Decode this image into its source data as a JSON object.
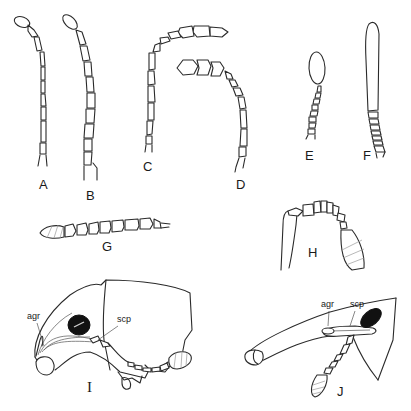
{
  "figure": {
    "panels": [
      {
        "id": "A",
        "label": "A",
        "subject": "antenna, filiform with slender club"
      },
      {
        "id": "B",
        "label": "B",
        "subject": "antenna, gradually thickened"
      },
      {
        "id": "C",
        "label": "C",
        "subject": "antenna, curved with 3-segmented club"
      },
      {
        "id": "D",
        "label": "D",
        "subject": "antenna, curved with rounded 3-segmented club"
      },
      {
        "id": "E",
        "label": "E",
        "subject": "antenna, elongate oval club"
      },
      {
        "id": "F",
        "label": "F",
        "subject": "antenna, very long solid club"
      },
      {
        "id": "G",
        "label": "G",
        "subject": "antenna, horizontal with hatched club"
      },
      {
        "id": "H",
        "label": "H",
        "subject": "antenna base with compact segments and hatched club"
      },
      {
        "id": "I",
        "label": "I",
        "subject": "head, lateral view with antennal groove"
      },
      {
        "id": "J",
        "label": "J",
        "subject": "head and rostrum, lateral view"
      }
    ],
    "annotations": {
      "I": {
        "agr": "agr",
        "scp": "scp"
      },
      "J": {
        "agr": "agr",
        "scp": "scp"
      }
    },
    "colors": {
      "ink": "#2a2a2a",
      "hatch": "#9a9a9a",
      "eye": "#111111",
      "background": "#ffffff"
    }
  }
}
